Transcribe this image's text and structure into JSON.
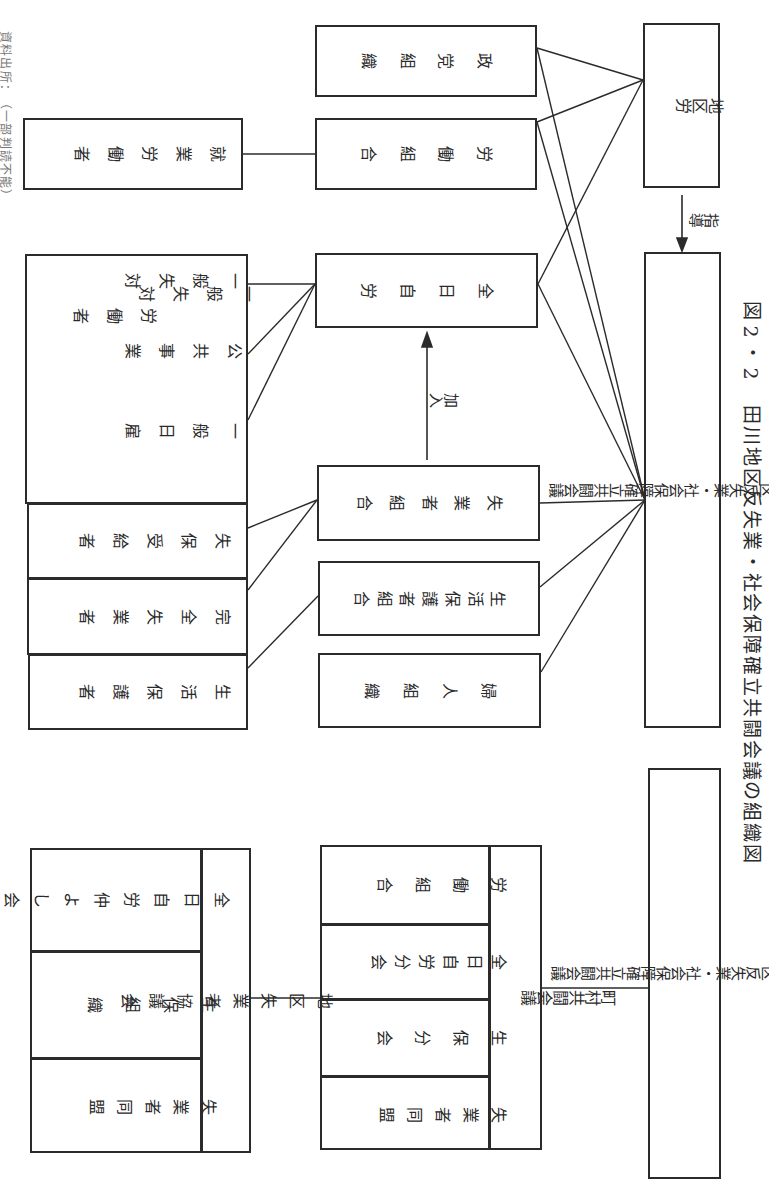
{
  "source_note": "資料出所：（一部判読不能）",
  "diagram1": {
    "chikuro": "地区労",
    "arrow_shido": "指導",
    "main_council": "田川地区反失業・社会保障確立共闘会議",
    "seito": "政党組織",
    "rodo_kumiai": "労働組合",
    "shugyo_rodosha": "就業労働者",
    "zennichi_jiro": "全日自労",
    "arrow_kanyu": "加入",
    "shitsugyosha_kumiai": "失業者組合",
    "seikatsu_hogosha_kumiai": "生活保護者組合",
    "fujin": "婦人組織",
    "worker_group": {
      "col1": "一般失対",
      "col1b": "労働者",
      "col2": "公共事業",
      "col3": "一般日雇",
      "shippo_jukyusha": "失保受給者",
      "kanzen_shitsugyosha": "完全失業者",
      "seikatsu_hogosha": "生活保護者"
    }
  },
  "diagram2": {
    "main_council": "田川地区反失業・社会保障確立共闘会議",
    "choson": {
      "header": "町村共闘会議",
      "members": [
        "労働組合",
        "全日自労分会",
        "生保分会",
        "失業者同盟"
      ]
    },
    "chiku_shitsugyosha": {
      "header": "地区失業者協議会",
      "members": [
        "全日自労仲よし会",
        "生保組織",
        "失業者同盟"
      ]
    }
  },
  "colors": {
    "line": "#2b2b2b",
    "background": "#ffffff"
  }
}
